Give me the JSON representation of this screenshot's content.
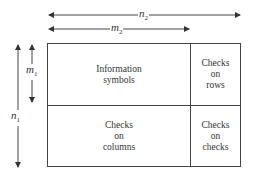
{
  "diagram": {
    "dimensions": {
      "n2": {
        "symbol": "n",
        "subscript": "2"
      },
      "m2": {
        "symbol": "m",
        "subscript": "2"
      },
      "m1": {
        "symbol": "m",
        "subscript": "1"
      },
      "n1": {
        "symbol": "n",
        "subscript": "1"
      }
    },
    "cells": {
      "top_left": "Information\nsymbols",
      "top_right": "Checks\non\nrows",
      "bottom_left": "Checks\non\ncolumns",
      "bottom_right": "Checks\non\nchecks"
    },
    "colors": {
      "line": "#444444",
      "text": "#333333",
      "background": "#ffffff"
    }
  }
}
